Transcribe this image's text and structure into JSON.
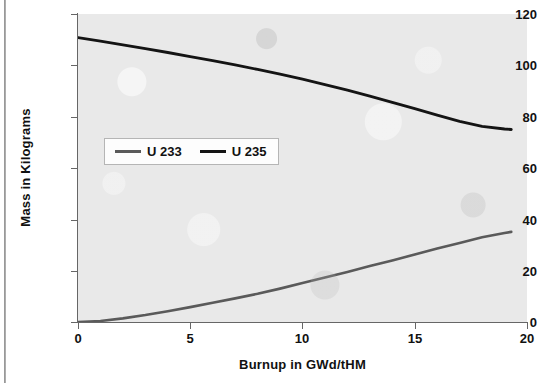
{
  "chart_data": {
    "type": "line",
    "title": "",
    "xlabel": "Burnup in GWd/tHM",
    "ylabel": "Mass in Kilograms",
    "xlim": [
      0,
      20
    ],
    "ylim": [
      0,
      120
    ],
    "xticks": [
      "0",
      "5",
      "10",
      "15",
      "20"
    ],
    "yticks": [
      "0",
      "20",
      "40",
      "60",
      "80",
      "100",
      "120"
    ],
    "grid": false,
    "legend_position": "inside-left-middle",
    "plot_background": "#e9e9e9",
    "series": [
      {
        "name": "U 233",
        "color": "#5a5a5a",
        "x": [
          0,
          1,
          2,
          3,
          4,
          5,
          6,
          7,
          8,
          9,
          10,
          11,
          12,
          13,
          14,
          15,
          16,
          17,
          18,
          19,
          19.3
        ],
        "values": [
          0.0,
          0.4,
          1.4,
          2.7,
          4.2,
          5.8,
          7.5,
          9.2,
          11.0,
          13.0,
          15.2,
          17.3,
          19.5,
          21.8,
          24.0,
          26.3,
          28.6,
          30.8,
          33.0,
          34.7,
          35.1
        ]
      },
      {
        "name": "U 235",
        "color": "#141414",
        "x": [
          0,
          1,
          2,
          3,
          4,
          5,
          6,
          7,
          8,
          9,
          10,
          11,
          12,
          13,
          14,
          15,
          16,
          17,
          18,
          19,
          19.3
        ],
        "values": [
          110.8,
          109.4,
          108.0,
          106.5,
          105.0,
          103.4,
          101.8,
          100.2,
          98.4,
          96.6,
          94.6,
          92.5,
          90.3,
          88.0,
          85.6,
          83.1,
          80.6,
          78.2,
          76.2,
          75.2,
          75.0
        ]
      }
    ]
  },
  "legend": {
    "items": [
      {
        "label": "U 233",
        "color": "#5a5a5a"
      },
      {
        "label": "U 235",
        "color": "#141414"
      }
    ]
  },
  "axes": {
    "y_title": "Mass in Kilograms",
    "x_title": "Burnup in GWd/tHM",
    "y_tick_labels": [
      "120",
      "100",
      "80",
      "60",
      "40",
      "20",
      "0"
    ],
    "x_tick_labels": [
      "0",
      "5",
      "10",
      "15",
      "20"
    ]
  }
}
